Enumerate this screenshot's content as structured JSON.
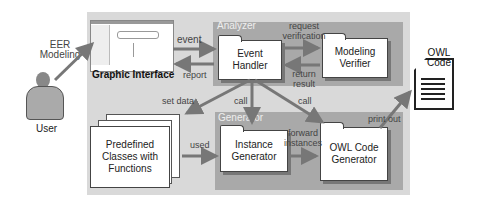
{
  "actors": {
    "user_label": "User",
    "eer_label": "EER Modeling"
  },
  "graphic_interface": {
    "label": "Graphic Interface"
  },
  "groups": {
    "analyzer": "Analyzer",
    "generator": "Generator"
  },
  "nodes": {
    "event_handler": "Event Handler",
    "modeling_verifier": "Modeling Verifier",
    "predefined_classes": "Predefined Classes with Functions",
    "instance_generator": "Instance Generator",
    "owl_code_generator": "OWL Code Generator",
    "owl_code_doc": "OWL Code"
  },
  "edges": {
    "event": "event",
    "report": "report",
    "request_verification": "request verification",
    "return_result": "return result",
    "set_data": "set data",
    "call_instance": "call",
    "call_owl": "call",
    "used": "used",
    "forward_instances": "forward instances",
    "print_out": "print out"
  }
}
